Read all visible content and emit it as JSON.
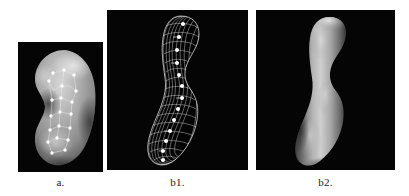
{
  "figure": {
    "background_color": "#ffffff",
    "panel_background_color": "#050505",
    "panels": [
      {
        "id": "a",
        "caption": "a.",
        "name": "shaded-kidney-surface-with-landmarks",
        "description": "Shaded three-dimensional kidney-bean shaped surface on black background with white landmark points connected by thin lines",
        "surface_color": "#9a9a9a",
        "highlight_color": "#d8d8d8",
        "landmark_color": "#ffffff",
        "landmark_count": 16
      },
      {
        "id": "b1",
        "caption": "b1.",
        "name": "wireframe-mesh-tube",
        "description": "White wireframe quadrilateral mesh of an S-curved tubular shape with white nodes along the central axis",
        "mesh_color": "#e8e8e8",
        "node_color": "#ffffff",
        "node_count": 13
      },
      {
        "id": "b2",
        "caption": "b2.",
        "name": "shaded-tube-surface",
        "description": "Smooth shaded gray S-curved tubular surface rendered on black background",
        "surface_color": "#a8a8a8",
        "highlight_color": "#d5d5d5",
        "shadow_color": "#4a4a4a"
      }
    ]
  }
}
